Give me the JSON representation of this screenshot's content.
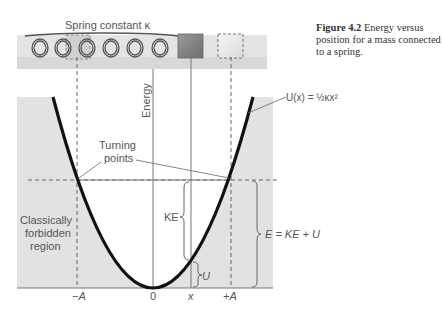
{
  "caption": {
    "label": "Figure 4.2",
    "text": "Energy versus position for a mass connected to a spring."
  },
  "spring": {
    "label": "Spring constant κ"
  },
  "axes": {
    "y_label": "Energy",
    "x_ticks": [
      "−A",
      "0",
      "x",
      "+A"
    ]
  },
  "annotations": {
    "potential": "U(x) = ½κx²",
    "turning_points_line1": "Turning",
    "turning_points_line2": "points",
    "forbidden_line1": "Classically",
    "forbidden_line2": "forbidden",
    "forbidden_line3": "region",
    "ke": "KE",
    "u": "U",
    "total": "E = KE + U"
  },
  "colors": {
    "background": "#ffffff",
    "shade": "#e2e2e2",
    "track": "#e0e0e0",
    "curve": "#111111",
    "line": "#777777",
    "mass": "#8a8a8a"
  }
}
